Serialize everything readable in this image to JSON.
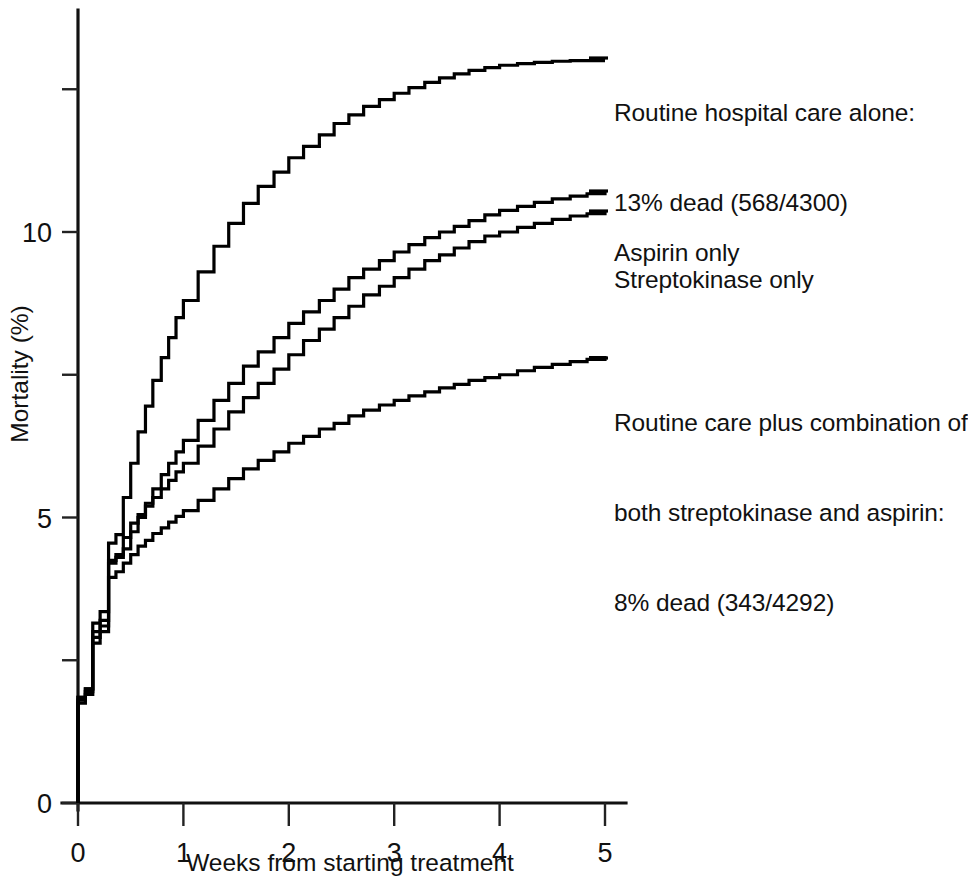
{
  "chart_data": {
    "type": "line",
    "title": "",
    "subtitle": "",
    "xlabel": "Weeks from starting treatment",
    "ylabel": "Mortality (%)",
    "xlim": [
      0,
      5.2
    ],
    "ylim": [
      0,
      13.9
    ],
    "grid": false,
    "legend_position": "right-inline-annotations",
    "step_style": "post",
    "x_ticks": [
      0,
      1,
      2,
      3,
      4,
      5
    ],
    "x_tick_labels": [
      "0",
      "1",
      "2",
      "3",
      "4",
      "5"
    ],
    "y_ticks": [
      0,
      2.5,
      5,
      7.5,
      10,
      12.5
    ],
    "y_tick_labels": [
      "0",
      "",
      "5",
      "",
      "10",
      ""
    ],
    "series": [
      {
        "name": "Routine hospital care alone",
        "label_line_1": "Routine hospital care alone:",
        "label_line_2": "13% dead (568/4300)",
        "final_value_percent": 13.0,
        "deaths": 568,
        "total": 4300,
        "x": [
          0,
          0.07,
          0.14,
          0.21,
          0.29,
          0.36,
          0.43,
          0.5,
          0.57,
          0.64,
          0.71,
          0.79,
          0.86,
          0.93,
          1.0,
          1.14,
          1.29,
          1.43,
          1.57,
          1.71,
          1.86,
          2.0,
          2.14,
          2.29,
          2.43,
          2.57,
          2.71,
          2.86,
          3.0,
          3.14,
          3.29,
          3.43,
          3.57,
          3.71,
          3.86,
          4.0,
          4.17,
          4.33,
          4.5,
          4.67,
          4.83,
          5.0
        ],
        "y": [
          1.85,
          2.0,
          3.15,
          3.35,
          4.55,
          4.7,
          5.35,
          5.95,
          6.5,
          6.95,
          7.4,
          7.8,
          8.15,
          8.5,
          8.8,
          9.3,
          9.75,
          10.15,
          10.5,
          10.8,
          11.05,
          11.3,
          11.5,
          11.7,
          11.9,
          12.05,
          12.2,
          12.32,
          12.43,
          12.53,
          12.62,
          12.7,
          12.77,
          12.83,
          12.88,
          12.92,
          12.95,
          12.97,
          12.99,
          13.0,
          13.0,
          13.0
        ]
      },
      {
        "name": "Aspirin only",
        "label_line_1": "Aspirin only",
        "final_value_percent": 10.7,
        "x": [
          0,
          0.07,
          0.14,
          0.21,
          0.29,
          0.36,
          0.43,
          0.5,
          0.57,
          0.64,
          0.71,
          0.79,
          0.86,
          0.93,
          1.0,
          1.14,
          1.29,
          1.43,
          1.57,
          1.71,
          1.86,
          2.0,
          2.14,
          2.29,
          2.43,
          2.57,
          2.71,
          2.86,
          3.0,
          3.14,
          3.29,
          3.43,
          3.57,
          3.71,
          3.86,
          4.0,
          4.17,
          4.33,
          4.5,
          4.67,
          4.83,
          5.0
        ],
        "y": [
          1.85,
          2.0,
          3.0,
          3.2,
          4.25,
          4.3,
          4.45,
          4.75,
          5.0,
          5.25,
          5.5,
          5.75,
          5.95,
          6.15,
          6.35,
          6.7,
          7.05,
          7.35,
          7.65,
          7.9,
          8.15,
          8.4,
          8.6,
          8.8,
          9.0,
          9.2,
          9.35,
          9.5,
          9.65,
          9.78,
          9.9,
          10.0,
          10.1,
          10.2,
          10.3,
          10.38,
          10.45,
          10.52,
          10.58,
          10.63,
          10.67,
          10.7
        ]
      },
      {
        "name": "Streptokinase only",
        "label_line_1": "Streptokinase only",
        "final_value_percent": 10.35,
        "x": [
          0,
          0.07,
          0.14,
          0.21,
          0.29,
          0.36,
          0.43,
          0.5,
          0.57,
          0.64,
          0.71,
          0.79,
          0.86,
          0.93,
          1.0,
          1.14,
          1.29,
          1.43,
          1.57,
          1.71,
          1.86,
          2.0,
          2.14,
          2.29,
          2.43,
          2.57,
          2.71,
          2.86,
          3.0,
          3.14,
          3.29,
          3.43,
          3.57,
          3.71,
          3.86,
          4.0,
          4.17,
          4.33,
          4.5,
          4.67,
          4.83,
          5.0
        ],
        "y": [
          1.8,
          1.95,
          2.9,
          3.1,
          4.2,
          4.35,
          4.65,
          4.9,
          5.05,
          5.2,
          5.35,
          5.5,
          5.65,
          5.8,
          5.95,
          6.25,
          6.55,
          6.85,
          7.1,
          7.35,
          7.6,
          7.85,
          8.1,
          8.3,
          8.5,
          8.7,
          8.9,
          9.05,
          9.2,
          9.35,
          9.5,
          9.6,
          9.72,
          9.83,
          9.93,
          10.0,
          10.08,
          10.15,
          10.22,
          10.28,
          10.32,
          10.35
        ]
      },
      {
        "name": "Routine care plus combination of both streptokinase and aspirin",
        "label_line_1": "Routine care plus combination of",
        "label_line_2": "both streptokinase and aspirin:",
        "label_line_3": "8% dead (343/4292)",
        "final_value_percent": 7.8,
        "deaths": 343,
        "total": 4292,
        "x": [
          0,
          0.07,
          0.14,
          0.21,
          0.29,
          0.36,
          0.43,
          0.5,
          0.57,
          0.64,
          0.71,
          0.79,
          0.86,
          0.93,
          1.0,
          1.14,
          1.29,
          1.43,
          1.57,
          1.71,
          1.86,
          2.0,
          2.14,
          2.29,
          2.43,
          2.57,
          2.71,
          2.86,
          3.0,
          3.14,
          3.29,
          3.43,
          3.57,
          3.71,
          3.86,
          4.0,
          4.17,
          4.33,
          4.5,
          4.67,
          4.83,
          5.0
        ],
        "y": [
          1.75,
          1.9,
          2.8,
          3.0,
          3.95,
          4.05,
          4.2,
          4.35,
          4.5,
          4.6,
          4.72,
          4.82,
          4.92,
          5.02,
          5.12,
          5.3,
          5.5,
          5.68,
          5.85,
          6.0,
          6.15,
          6.3,
          6.42,
          6.55,
          6.65,
          6.78,
          6.88,
          6.97,
          7.05,
          7.13,
          7.2,
          7.27,
          7.33,
          7.4,
          7.45,
          7.5,
          7.57,
          7.63,
          7.68,
          7.73,
          7.77,
          7.8
        ]
      }
    ]
  },
  "axes": {
    "x_title": "Weeks from starting treatment",
    "y_title": "Mortality (%)"
  },
  "annotations": {
    "routine_care_alone": {
      "line1": "Routine hospital care alone:",
      "line2": "13% dead (568/4300)"
    },
    "aspirin_only": {
      "line1": "Aspirin only"
    },
    "streptokinase_only": {
      "line1": "Streptokinase only"
    },
    "combination": {
      "line1": "Routine care plus combination of",
      "line2": "both streptokinase and aspirin:",
      "line3": "8% dead (343/4292)"
    }
  },
  "colors": {
    "line": "#000000",
    "axis": "#111111",
    "background": "#ffffff"
  }
}
